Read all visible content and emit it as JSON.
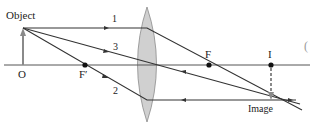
{
  "diagram": {
    "labels": {
      "object": "Object",
      "image": "Image",
      "origin": "O",
      "focal_near": "F′",
      "focal_far": "F",
      "image_point": "I",
      "edge_glyph": "("
    },
    "rays": [
      {
        "id": "1",
        "label": "1",
        "description": "parallel ray, refracts through F"
      },
      {
        "id": "2",
        "label": "2",
        "description": "ray through F′, exits parallel"
      },
      {
        "id": "3",
        "label": "3",
        "description": "central ray, passes undeviated"
      }
    ],
    "colors": {
      "lines": "#333333",
      "lens_fill": "#d0d0d0",
      "lens_stroke": "#8a8a8a",
      "object_arrow": "#8a8a8a",
      "image_arrow": "#8a8a8a"
    }
  }
}
